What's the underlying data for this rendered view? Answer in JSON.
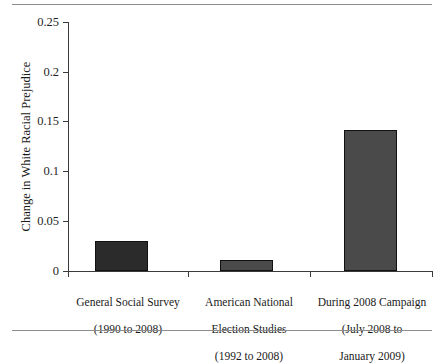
{
  "chart_data": {
    "type": "bar",
    "title": "",
    "xlabel": "",
    "ylabel": "Change in White Racial Prejudice",
    "ylim": [
      0,
      0.25
    ],
    "yticks": [
      "0",
      "0.05",
      "0.1",
      "0.15",
      "0.2",
      "0.25"
    ],
    "ytick_values": [
      0,
      0.05,
      0.1,
      0.15,
      0.2,
      0.25
    ],
    "grid": false,
    "legend": false,
    "categories": [
      "General Social Survey\n(1990 to 2008)",
      "American National\nElection Studies\n(1992 to 2008)",
      "During 2008 Campaign\n(July 2008 to\nJanuary 2009)"
    ],
    "category_names": [
      "General Social Survey",
      "American National Election Studies",
      "During 2008 Campaign"
    ],
    "category_periods": [
      "(1990 to 2008)",
      "(1992 to 2008)",
      "(July 2008 to January 2009)"
    ],
    "values": [
      0.03,
      0.011,
      0.142
    ],
    "bar_colors": [
      "#2b2b2b",
      "#4a4a4a",
      "#4a4a4a"
    ]
  },
  "axis": {
    "y_title": "Change in White Racial Prejudice",
    "tick_0": "0",
    "tick_1": "0.05",
    "tick_2": "0.1",
    "tick_3": "0.15",
    "tick_4": "0.2",
    "tick_5": "0.25"
  },
  "labels": {
    "cat0_line0": "General Social Survey",
    "cat0_line1": "(1990 to 2008)",
    "cat1_line0": "American National",
    "cat1_line1": "Election Studies",
    "cat1_line2": "(1992 to 2008)",
    "cat2_line0": "During 2008 Campaign",
    "cat2_line1": "(July 2008 to",
    "cat2_line2": "January 2009)"
  }
}
